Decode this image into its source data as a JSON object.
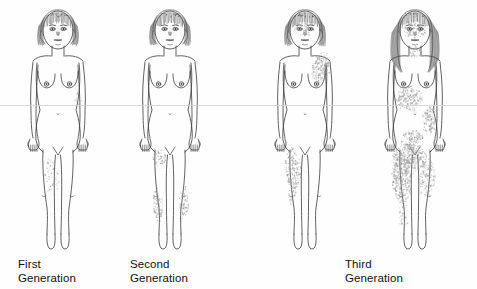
{
  "figure": {
    "background_color": "#fefefe",
    "outline_color": "#3a3a3a",
    "lesion_color": "#9a9a9a",
    "hair_color": "#4a4a4a",
    "text_color": "#111111",
    "scanline_color": "#d2d4d8",
    "scanline_y": 105
  },
  "captions": {
    "first": "First\nGeneration",
    "second": "Second\nGeneration",
    "third": "Third\nGeneration"
  },
  "subjects": [
    {
      "id": "subject-1",
      "generation": "First Generation",
      "center_x": 58,
      "hair_style": "bob-with-bangs",
      "hair_length": "short",
      "severity": "minimal",
      "lesion_regions": [
        {
          "region": "right-thigh-inner",
          "cx": 52,
          "cy": 178,
          "rx": 7,
          "ry": 20,
          "density": 0.18,
          "rotate": -6
        },
        {
          "region": "left-shoulder-faint",
          "cx": 78,
          "cy": 98,
          "rx": 5,
          "ry": 10,
          "density": 0.1,
          "rotate": 8
        }
      ]
    },
    {
      "id": "subject-2",
      "generation": "Second Generation",
      "center_x": 170,
      "hair_style": "bob-with-bangs",
      "hair_length": "short",
      "severity": "mild",
      "lesion_regions": [
        {
          "region": "right-thigh",
          "cx": 159,
          "cy": 158,
          "rx": 7,
          "ry": 9,
          "density": 0.4,
          "rotate": 0
        },
        {
          "region": "right-shin",
          "cx": 158,
          "cy": 205,
          "rx": 5,
          "ry": 17,
          "density": 0.45,
          "rotate": -4
        },
        {
          "region": "left-shin",
          "cx": 184,
          "cy": 203,
          "rx": 5,
          "ry": 17,
          "density": 0.45,
          "rotate": 4
        }
      ]
    },
    {
      "id": "subject-3",
      "generation": "Third Generation",
      "center_x": 305,
      "hair_style": "bob-with-bangs",
      "hair_length": "short",
      "severity": "moderate",
      "lesion_regions": [
        {
          "region": "face-cheeks",
          "cx": 305,
          "cy": 28,
          "rx": 10,
          "ry": 8,
          "density": 0.3,
          "rotate": 0
        },
        {
          "region": "left-neck-shoulder",
          "cx": 321,
          "cy": 68,
          "rx": 9,
          "ry": 16,
          "density": 0.55,
          "rotate": 12
        },
        {
          "region": "right-thigh",
          "cx": 293,
          "cy": 168,
          "rx": 8,
          "ry": 22,
          "density": 0.5,
          "rotate": -5
        },
        {
          "region": "right-knee",
          "cx": 292,
          "cy": 196,
          "rx": 5,
          "ry": 9,
          "density": 0.3,
          "rotate": 0
        }
      ]
    },
    {
      "id": "subject-4",
      "generation": "Third Generation",
      "center_x": 415,
      "hair_style": "long-straight-with-bangs",
      "hair_length": "long",
      "severity": "severe",
      "lesion_regions": [
        {
          "region": "face-full",
          "cx": 415,
          "cy": 30,
          "rx": 12,
          "ry": 10,
          "density": 0.45,
          "rotate": 0
        },
        {
          "region": "neck",
          "cx": 415,
          "cy": 52,
          "rx": 8,
          "ry": 6,
          "density": 0.4,
          "rotate": 0
        },
        {
          "region": "chest-upper",
          "cx": 409,
          "cy": 98,
          "rx": 14,
          "ry": 12,
          "density": 0.55,
          "rotate": 0
        },
        {
          "region": "left-flank",
          "cx": 430,
          "cy": 120,
          "rx": 8,
          "ry": 14,
          "density": 0.5,
          "rotate": 8
        },
        {
          "region": "abdomen-lower",
          "cx": 412,
          "cy": 140,
          "rx": 12,
          "ry": 10,
          "density": 0.45,
          "rotate": 0
        },
        {
          "region": "groin-pelvis",
          "cx": 410,
          "cy": 158,
          "rx": 18,
          "ry": 14,
          "density": 0.65,
          "rotate": 0
        },
        {
          "region": "right-thigh",
          "cx": 402,
          "cy": 180,
          "rx": 10,
          "ry": 24,
          "density": 0.6,
          "rotate": -4
        },
        {
          "region": "left-thigh",
          "cx": 427,
          "cy": 178,
          "rx": 8,
          "ry": 20,
          "density": 0.45,
          "rotate": 5
        },
        {
          "region": "right-shin",
          "cx": 404,
          "cy": 216,
          "rx": 5,
          "ry": 16,
          "density": 0.3,
          "rotate": 0
        }
      ]
    }
  ]
}
